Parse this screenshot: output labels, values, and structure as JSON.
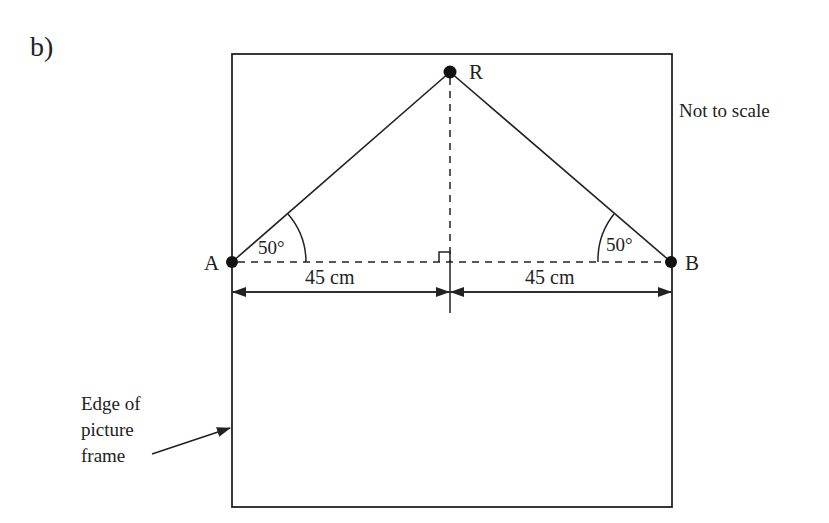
{
  "part_label": "b)",
  "note": "Not to scale",
  "points": {
    "A": "A",
    "B": "B",
    "R": "R"
  },
  "angles": {
    "at_A": "50°",
    "at_B": "50°"
  },
  "measurements": {
    "left_half": "45 cm",
    "right_half": "45 cm"
  },
  "frame_label": {
    "line1": "Edge of",
    "line2": "picture",
    "line3": "frame"
  },
  "colors": {
    "ink": "#222222",
    "background": "#ffffff"
  }
}
